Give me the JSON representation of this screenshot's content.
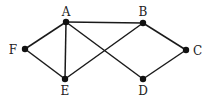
{
  "diagram": {
    "type": "undirected-graph",
    "nodes": [
      {
        "id": "A",
        "label": "A",
        "x": 66,
        "y": 22,
        "lx": 66,
        "ly": 16,
        "anchor": "middle"
      },
      {
        "id": "B",
        "label": "B",
        "x": 143,
        "y": 23,
        "lx": 143,
        "ly": 16,
        "anchor": "middle"
      },
      {
        "id": "C",
        "label": "C",
        "x": 186,
        "y": 50,
        "lx": 193,
        "ly": 55,
        "anchor": "start"
      },
      {
        "id": "D",
        "label": "D",
        "x": 143,
        "y": 79,
        "lx": 143,
        "ly": 95,
        "anchor": "middle"
      },
      {
        "id": "E",
        "label": "E",
        "x": 65,
        "y": 79,
        "lx": 65,
        "ly": 95,
        "anchor": "middle"
      },
      {
        "id": "F",
        "label": "F",
        "x": 25,
        "y": 49,
        "lx": 17,
        "ly": 54,
        "anchor": "end"
      }
    ],
    "edges": [
      {
        "from": "A",
        "to": "B"
      },
      {
        "from": "A",
        "to": "F"
      },
      {
        "from": "A",
        "to": "E"
      },
      {
        "from": "A",
        "to": "D"
      },
      {
        "from": "B",
        "to": "E"
      },
      {
        "from": "B",
        "to": "C"
      },
      {
        "from": "C",
        "to": "D"
      },
      {
        "from": "F",
        "to": "E"
      }
    ],
    "colors": {
      "edge": "#1a1a1a",
      "node": "#111111",
      "label": "#222222",
      "background": "#ffffff"
    }
  }
}
